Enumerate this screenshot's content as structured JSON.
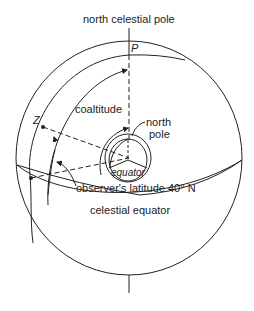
{
  "diagram": {
    "labels": {
      "ncp": "north celestial pole",
      "p": "P",
      "z": "Z",
      "coaltitude": "coaltitude",
      "north_pole_1": "north",
      "north_pole_2": "pole",
      "equator": "equator",
      "latitude": "observer's latitude 40° N",
      "celestial_equator": "celestial equator"
    },
    "colors": {
      "line": "#222222",
      "background": "#ffffff"
    }
  }
}
